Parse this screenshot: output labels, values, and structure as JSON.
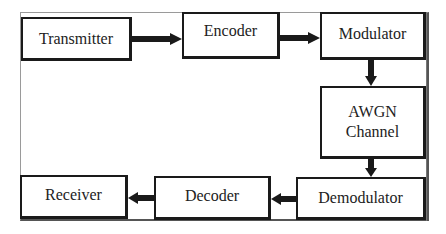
{
  "diagram": {
    "type": "block-diagram",
    "title": "",
    "colors": {
      "stroke": "#1a1a1a",
      "background": "#ffffff",
      "text": "#222222"
    },
    "nodes": [
      {
        "id": "transmitter",
        "label": "Transmitter"
      },
      {
        "id": "encoder",
        "label": "Encoder"
      },
      {
        "id": "modulator",
        "label": "Modulator"
      },
      {
        "id": "awgn",
        "label_line1": "AWGN",
        "label_line2": "Channel"
      },
      {
        "id": "demodulator",
        "label": "Demodulator"
      },
      {
        "id": "decoder",
        "label": "Decoder"
      },
      {
        "id": "receiver",
        "label": "Receiver"
      }
    ],
    "edges": [
      {
        "from": "transmitter",
        "to": "encoder"
      },
      {
        "from": "encoder",
        "to": "modulator"
      },
      {
        "from": "modulator",
        "to": "awgn"
      },
      {
        "from": "awgn",
        "to": "demodulator"
      },
      {
        "from": "demodulator",
        "to": "decoder"
      },
      {
        "from": "decoder",
        "to": "receiver"
      }
    ]
  }
}
